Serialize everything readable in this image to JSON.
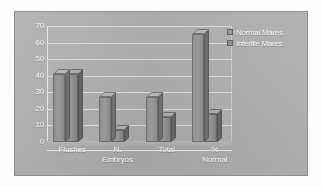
{
  "chart_data": {
    "type": "bar",
    "title": "",
    "subtitle": "",
    "xlabel": "",
    "ylabel": "",
    "categories": [
      "Flushes",
      "N.\nEmbryos",
      "Total",
      "%\nNormal"
    ],
    "series": [
      {
        "name": "Normal Mares",
        "values": [
          41,
          27,
          27,
          65
        ]
      },
      {
        "name": "Infertile Mares",
        "values": [
          41,
          7,
          15,
          17
        ]
      }
    ],
    "ylim": [
      0,
      70
    ],
    "yticks": [
      70,
      60,
      50,
      40,
      30,
      20,
      10,
      0
    ],
    "grid": true,
    "legend_position": "top-right",
    "style": "3d-bar-grayscale",
    "colors": {
      "series_normal_mares": "#949494",
      "series_infertile_mares": "#8d8d8d",
      "plot_background": "#ababab",
      "panel_background": "#aaaaaa",
      "gridline": "#dededc",
      "tick_label": "#f2f2ef",
      "figure_background": "#fdfdfd"
    }
  },
  "legend": {
    "items": [
      {
        "label": "Normal Mares"
      },
      {
        "label": "Infertile Mares"
      }
    ]
  }
}
